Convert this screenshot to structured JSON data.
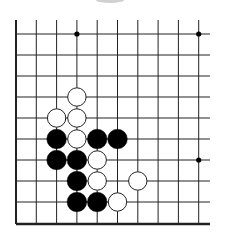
{
  "diagram": {
    "type": "go-board-fragment",
    "grid": {
      "columns": 10,
      "rows": 10,
      "x_coords": [
        16,
        36.3,
        56.6,
        76.9,
        97.2,
        117.5,
        137.8,
        158.1,
        178.4,
        198.7
      ],
      "y_coords": [
        34,
        55,
        76,
        97,
        118,
        139,
        160,
        181,
        202,
        224
      ],
      "line_color": "#222222",
      "right_extend_to": 210,
      "top_extend_from": 20,
      "left_edge": true,
      "bottom_edge": true
    },
    "star_points": [
      [
        3,
        0
      ],
      [
        9,
        0
      ],
      [
        9,
        6
      ]
    ],
    "stones": [
      {
        "color": "white",
        "col": 3,
        "row": 3
      },
      {
        "color": "white",
        "col": 2,
        "row": 4
      },
      {
        "color": "white",
        "col": 3,
        "row": 4
      },
      {
        "color": "black",
        "col": 2,
        "row": 5
      },
      {
        "color": "white",
        "col": 3,
        "row": 5
      },
      {
        "color": "black",
        "col": 4,
        "row": 5
      },
      {
        "color": "black",
        "col": 5,
        "row": 5
      },
      {
        "color": "black",
        "col": 2,
        "row": 6
      },
      {
        "color": "black",
        "col": 3,
        "row": 6
      },
      {
        "color": "white",
        "col": 4,
        "row": 6
      },
      {
        "color": "black",
        "col": 3,
        "row": 7
      },
      {
        "color": "white",
        "col": 4,
        "row": 7
      },
      {
        "color": "white",
        "col": 6,
        "row": 7
      },
      {
        "color": "black",
        "col": 3,
        "row": 8
      },
      {
        "color": "black",
        "col": 4,
        "row": 8
      },
      {
        "color": "white",
        "col": 5,
        "row": 8
      }
    ],
    "colors": {
      "black_stone": "#000000",
      "white_stone_fill": "#ffffff",
      "white_stone_stroke": "#222222",
      "background": "#ffffff",
      "top_smudge": "#cccccc"
    }
  }
}
